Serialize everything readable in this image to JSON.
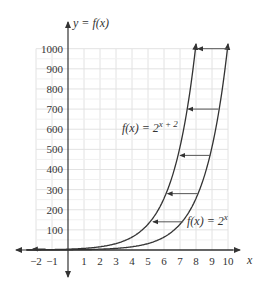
{
  "chart_data": {
    "type": "line",
    "title": "",
    "xlabel": "x",
    "ylabel": "y = f(x)",
    "xlim": [
      -2,
      10
    ],
    "ylim": [
      0,
      1000
    ],
    "grid": true,
    "x_ticks": [
      "−2",
      "−1",
      "1",
      "2",
      "3",
      "4",
      "5",
      "6",
      "7",
      "8",
      "9",
      "10"
    ],
    "y_ticks": [
      "100",
      "200",
      "300",
      "400",
      "500",
      "600",
      "700",
      "800",
      "900",
      "1000"
    ],
    "series": [
      {
        "name": "f(x) = 2^x",
        "label_base": "f(x) = 2",
        "label_exp": "x",
        "x": [
          -2,
          0,
          2,
          4,
          6,
          8,
          9,
          10
        ],
        "y": [
          0.25,
          1,
          4,
          16,
          64,
          256,
          512,
          1024
        ]
      },
      {
        "name": "f(x) = 2^(x+2)",
        "label_base": "f(x) = 2",
        "label_exp": "x+2",
        "x": [
          -4,
          -2,
          0,
          2,
          4,
          6,
          7,
          8
        ],
        "y": [
          0.0625,
          0.25,
          1,
          4,
          16,
          64,
          128,
          256
        ]
      }
    ],
    "annotations": [
      {
        "type": "arrow",
        "from": [
          10,
          1000
        ],
        "to": [
          8,
          1000
        ],
        "note": "horizontal shift left 2"
      },
      {
        "type": "arrow",
        "from": [
          9.4,
          700
        ],
        "to": [
          7.4,
          700
        ]
      },
      {
        "type": "arrow",
        "from": [
          8.9,
          470
        ],
        "to": [
          6.9,
          470
        ]
      },
      {
        "type": "arrow",
        "from": [
          8.1,
          280
        ],
        "to": [
          6.1,
          280
        ]
      },
      {
        "type": "arrow",
        "from": [
          7.2,
          140
        ],
        "to": [
          5.2,
          140
        ]
      }
    ]
  },
  "labels": {
    "y_axis": "y = f(x)",
    "x_axis": "x",
    "curve_shifted_base": "f(x) = 2",
    "curve_shifted_exp": "x + 2",
    "curve_base_base": "f(x) = 2",
    "curve_base_exp": "x"
  }
}
